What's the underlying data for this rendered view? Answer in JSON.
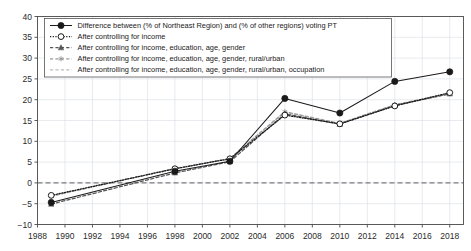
{
  "chart_data": {
    "type": "line",
    "title": "",
    "subtitle": "",
    "xlabel": "",
    "ylabel": "",
    "xlim": [
      1988,
      2019
    ],
    "ylim": [
      -10,
      40
    ],
    "grid": true,
    "legend_position": "top-left",
    "x_ticks": [
      1988,
      1990,
      1992,
      1994,
      1996,
      1998,
      2000,
      2002,
      2004,
      2006,
      2008,
      2010,
      2012,
      2014,
      2016,
      2018
    ],
    "y_ticks": [
      -10,
      -5,
      0,
      5,
      10,
      15,
      20,
      25,
      30,
      35,
      40
    ],
    "zero_reference_line": 0,
    "x": [
      1989,
      1998,
      2002,
      2006,
      2010,
      2014,
      2018
    ],
    "series": [
      {
        "name": "Difference between (% of Northeast Region) and (% of other regions) voting PT",
        "values": [
          -4.7,
          2.8,
          5.2,
          20.3,
          16.8,
          24.4,
          26.7
        ],
        "marker": "filled-circle",
        "linestyle": "solid",
        "color": "#1a1a1a"
      },
      {
        "name": "After controlling for income",
        "values": [
          -3.0,
          3.4,
          5.8,
          16.3,
          14.2,
          18.5,
          21.7
        ],
        "marker": "open-circle",
        "linestyle": "dotted",
        "color": "#1a1a1a"
      },
      {
        "name": "After controlling for income, education, age, gender",
        "values": [
          -5.1,
          2.4,
          5.1,
          16.6,
          14.1,
          18.6,
          21.4
        ],
        "marker": "filled-triangle",
        "linestyle": "dashed",
        "color": "#555555"
      },
      {
        "name": "After controlling for income, education, age, gender, rural/urban",
        "values": [
          -3.2,
          3.5,
          5.9,
          17.1,
          14.3,
          18.8,
          21.5
        ],
        "marker": "small-star",
        "linestyle": "dashed",
        "color": "#9a9a9a"
      },
      {
        "name": "After controlling for income, education, age, gender, rural/urban, occupation",
        "values": [
          -3.1,
          3.4,
          5.8,
          17.0,
          14.2,
          18.7,
          21.5
        ],
        "marker": "none",
        "linestyle": "dashed",
        "color": "#bdbdbd"
      }
    ]
  },
  "colors": {
    "background": "#ffffff",
    "frame": "#4a4a4a",
    "grid": "#d8dce3",
    "text": "#1a1a1a",
    "zero_line": "#3a3a3a"
  }
}
